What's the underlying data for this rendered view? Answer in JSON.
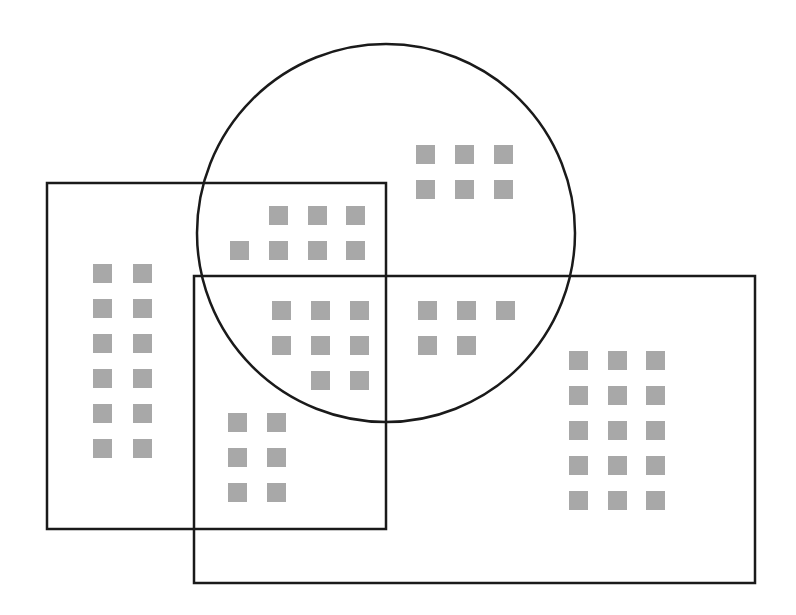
{
  "diagram": {
    "type": "venn",
    "stroke_color": "#1a1a1a",
    "stroke_width": 2.5,
    "item_color": "#a8a8a8",
    "item_size": 19,
    "shapes": [
      {
        "id": "rect-a",
        "kind": "rect",
        "x": 47,
        "y": 183,
        "w": 339,
        "h": 346
      },
      {
        "id": "rect-b",
        "kind": "rect",
        "x": 194,
        "y": 276,
        "w": 561,
        "h": 307
      },
      {
        "id": "circle-c",
        "kind": "circle",
        "cx": 386,
        "cy": 233,
        "r": 189
      }
    ],
    "groups": [
      {
        "region": "A only",
        "count": 12,
        "items": [
          [
            93,
            264
          ],
          [
            133,
            264
          ],
          [
            93,
            299
          ],
          [
            133,
            299
          ],
          [
            93,
            334
          ],
          [
            133,
            334
          ],
          [
            93,
            369
          ],
          [
            133,
            369
          ],
          [
            93,
            404
          ],
          [
            133,
            404
          ],
          [
            93,
            439
          ],
          [
            133,
            439
          ]
        ]
      },
      {
        "region": "A and C",
        "count": 7,
        "items": [
          [
            269,
            206
          ],
          [
            308,
            206
          ],
          [
            346,
            206
          ],
          [
            230,
            241
          ],
          [
            269,
            241
          ],
          [
            308,
            241
          ],
          [
            346,
            241
          ]
        ]
      },
      {
        "region": "C only",
        "count": 6,
        "items": [
          [
            416,
            145
          ],
          [
            455,
            145
          ],
          [
            494,
            145
          ],
          [
            416,
            180
          ],
          [
            455,
            180
          ],
          [
            494,
            180
          ]
        ]
      },
      {
        "region": "A and B and C",
        "count": 8,
        "items": [
          [
            272,
            301
          ],
          [
            311,
            301
          ],
          [
            350,
            301
          ],
          [
            272,
            336
          ],
          [
            311,
            336
          ],
          [
            350,
            336
          ],
          [
            311,
            371
          ],
          [
            350,
            371
          ]
        ]
      },
      {
        "region": "B and C",
        "count": 5,
        "items": [
          [
            418,
            301
          ],
          [
            457,
            301
          ],
          [
            496,
            301
          ],
          [
            418,
            336
          ],
          [
            457,
            336
          ]
        ]
      },
      {
        "region": "A and B",
        "count": 6,
        "items": [
          [
            228,
            413
          ],
          [
            267,
            413
          ],
          [
            228,
            448
          ],
          [
            267,
            448
          ],
          [
            228,
            483
          ],
          [
            267,
            483
          ]
        ]
      },
      {
        "region": "B only",
        "count": 15,
        "items": [
          [
            569,
            351
          ],
          [
            608,
            351
          ],
          [
            646,
            351
          ],
          [
            569,
            386
          ],
          [
            608,
            386
          ],
          [
            646,
            386
          ],
          [
            569,
            421
          ],
          [
            608,
            421
          ],
          [
            646,
            421
          ],
          [
            569,
            456
          ],
          [
            608,
            456
          ],
          [
            646,
            456
          ],
          [
            569,
            491
          ],
          [
            608,
            491
          ],
          [
            646,
            491
          ]
        ]
      }
    ]
  }
}
